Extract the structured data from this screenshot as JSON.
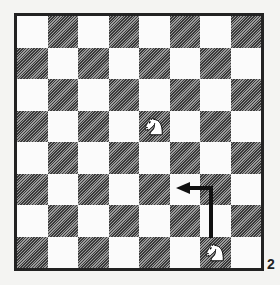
{
  "diagram": {
    "number": "2",
    "board_size": 8,
    "top_left_square_color": "light",
    "colors": {
      "light_square": "#fbfbfb",
      "dark_square_hatch": "#3a3a3a",
      "border": "#222222",
      "arrow": "#111111"
    },
    "pieces": [
      {
        "type": "knight",
        "color": "white",
        "square": "e5",
        "row": 3,
        "col": 4,
        "icon": "white-knight-icon"
      },
      {
        "type": "knight",
        "color": "white",
        "square": "g1",
        "row": 7,
        "col": 6,
        "icon": "white-knight-icon"
      }
    ],
    "arrow": {
      "from": "g1",
      "via": "g3",
      "to": "f3",
      "description": "Knight move path: up two squares, then one left"
    }
  }
}
